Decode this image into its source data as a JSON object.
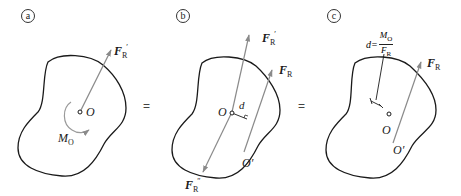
{
  "diagram": {
    "panels": [
      {
        "id": "a",
        "label": "a",
        "point_O": "O",
        "force_label": "F",
        "force_sub": "R",
        "force_prime": "′",
        "moment_label": "M",
        "moment_sub": "O"
      },
      {
        "id": "b",
        "label": "b",
        "point_O": "O",
        "point_O_prime": "O′",
        "distance_label": "d",
        "force_top_label": "F",
        "force_top_sub": "R",
        "force_top_prime": "′",
        "force_R_label": "F",
        "force_R_sub": "R",
        "force_bottom_label": "F",
        "force_bottom_sub": "R",
        "force_bottom_prime": "″"
      },
      {
        "id": "c",
        "label": "c",
        "point_O": "O",
        "point_O_prime": "O′",
        "force_R_label": "F",
        "force_R_sub": "R",
        "formula_lhs": "d=",
        "formula_num": "M",
        "formula_num_sub": "O",
        "formula_den": "F",
        "formula_den_sub": "R"
      }
    ],
    "equals_signs": [
      "=",
      "="
    ],
    "colors": {
      "outline": "#1a1a1a",
      "force_arrow": "#8a8a8a",
      "text": "#1a1a1a"
    }
  }
}
